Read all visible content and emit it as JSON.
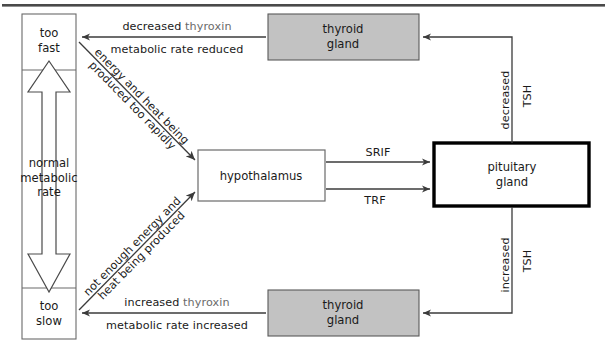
{
  "diagram": {
    "title_rule": "",
    "colors": {
      "line": "#3b3b3b",
      "thyroid_fill": "#c2c2c2",
      "thyroid_stroke": "#5a5a5a",
      "pituitary_stroke": "#000000",
      "text": "#1a1a1a",
      "muted_text": "#6a6a6a",
      "background": "#ffffff"
    },
    "scale_box": {
      "top_label": "too\nfast",
      "top_label_line1": "too",
      "top_label_line2": "fast",
      "middle_label_line1": "normal",
      "middle_label_line2": "metabolic",
      "middle_label_line3": "rate",
      "bottom_label_line1": "too",
      "bottom_label_line2": "slow"
    },
    "nodes": [
      {
        "id": "thyroid-top",
        "label_line1": "thyroid",
        "label_line2": "gland",
        "style": "shaded"
      },
      {
        "id": "thyroid-bottom",
        "label_line1": "thyroid",
        "label_line2": "gland",
        "style": "shaded"
      },
      {
        "id": "hypothalamus",
        "label_line1": "hypothalamus",
        "label_line2": "",
        "style": "plain"
      },
      {
        "id": "pituitary",
        "label_line1": "pituitary",
        "label_line2": "gland",
        "style": "bold"
      }
    ],
    "edges": {
      "thyroid_top_to_fast": {
        "line1_strong": "decreased",
        "line1_muted": "thyroxin",
        "line2": "metabolic rate reduced"
      },
      "thyroid_bottom_to_slow": {
        "line1_strong": "increased",
        "line1_muted": "thyroxin",
        "line2": "metabolic rate increased"
      },
      "fast_to_hypothalamus": {
        "line1": "energy and heat being",
        "line2": "produced too rapidly"
      },
      "slow_to_hypothalamus": {
        "line1": "not enough energy and",
        "line2": "heat being produced"
      },
      "hypothalamus_to_pituitary_upper": {
        "label": "SRIF"
      },
      "hypothalamus_to_pituitary_lower": {
        "label": "TRF"
      },
      "pituitary_to_thyroid_top": {
        "label_a": "decreased",
        "label_b": "TSH"
      },
      "pituitary_to_thyroid_bottom": {
        "label_a": "increased",
        "label_b": "TSH"
      }
    }
  }
}
